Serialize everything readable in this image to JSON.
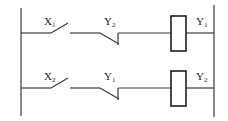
{
  "diagram": {
    "type": "ladder-logic",
    "rungs": [
      {
        "contacts": [
          {
            "type": "normally-open",
            "label": "X",
            "sub": "1"
          },
          {
            "type": "normally-closed",
            "label": "Y",
            "sub": "2"
          }
        ],
        "coil": {
          "label": "Y",
          "sub": "1"
        }
      },
      {
        "contacts": [
          {
            "type": "normally-open",
            "label": "X",
            "sub": "2"
          },
          {
            "type": "normally-closed",
            "label": "Y",
            "sub": "1"
          }
        ],
        "coil": {
          "label": "Y",
          "sub": "2"
        }
      }
    ],
    "colors": {
      "line": "#3a3a3a",
      "background": "#ffffff"
    }
  }
}
